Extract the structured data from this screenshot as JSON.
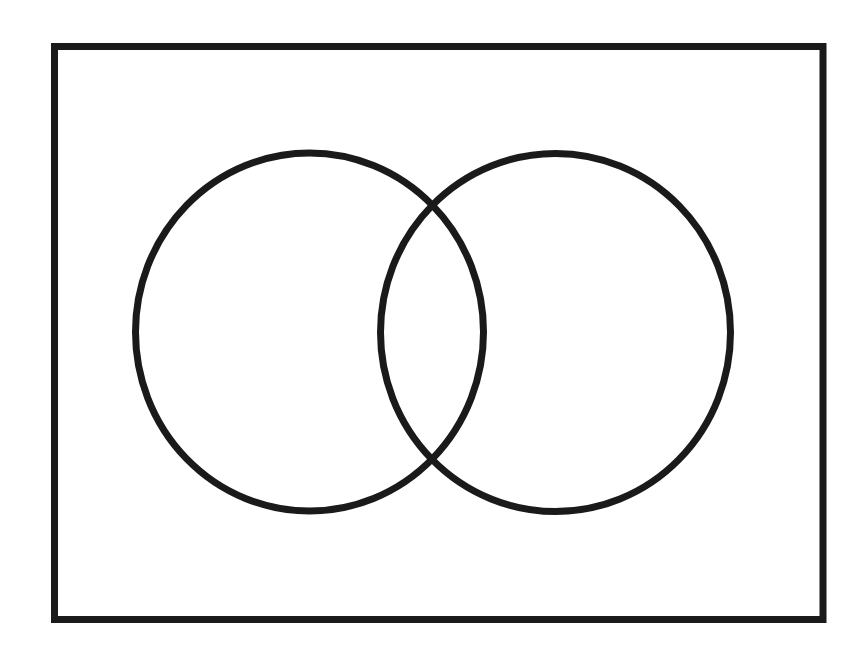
{
  "diagram": {
    "type": "venn",
    "sets_count": 2,
    "background_color": "#ffffff",
    "stroke_color": "#1a1a1a",
    "stroke_width": 7,
    "universe": {
      "shape": "rectangle",
      "x": 54.5,
      "y": 46.5,
      "width": 768.5,
      "height": 573,
      "label": ""
    },
    "sets": [
      {
        "name": "left-set",
        "label": "",
        "cx": 309.5,
        "cy": 332,
        "rx": 174,
        "ry": 179
      },
      {
        "name": "right-set",
        "label": "",
        "cx": 555.5,
        "cy": 332.5,
        "rx": 175,
        "ry": 179
      }
    ]
  }
}
